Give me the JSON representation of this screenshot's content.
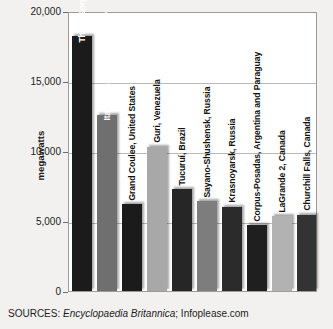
{
  "chart_data": {
    "type": "bar",
    "title": "",
    "xlabel": "",
    "ylabel": "megawatts",
    "ylim": [
      0,
      20000
    ],
    "grid": true,
    "legend": "none",
    "yticks": [
      "0",
      "5,000",
      "10,000",
      "15,000",
      "20,000"
    ],
    "ytick_values": [
      0,
      5000,
      10000,
      15000,
      20000
    ],
    "categories": [
      "Three Gorges, China",
      "Itaipu, Brazil and Paraguay",
      "Grand Coulee, United States",
      "Guri, Venezuela",
      "Tucuruí, Brazil",
      "Sayano-Shushensk, Russia",
      "Krasnoyarsk, Russia",
      "Corpus-Posadas, Argentina and Paraguay",
      "LaGrande 2, Canada",
      "Churchill Falls, Canada"
    ],
    "values": [
      18200,
      12600,
      6180,
      10300,
      7260,
      6400,
      6000,
      4700,
      5328,
      5428
    ],
    "bar_colors": [
      "#1b1b1b",
      "#6f6f6f",
      "#1b1b1b",
      "#a8a8a8",
      "#262626",
      "#7d7d7d",
      "#2b2b2b",
      "#1f1f1f",
      "#b2b2b2",
      "#333333"
    ],
    "label_placement": [
      "inside",
      "inside",
      "outside",
      "outside",
      "outside",
      "outside",
      "outside",
      "outside",
      "outside",
      "outside"
    ]
  },
  "footer": {
    "sources_prefix": "SOURCES:",
    "source_italic": "Encyclopaedia Britannica",
    "source_rest": "; Infoplease.com"
  },
  "colors": {
    "plot_background": "#ffffff",
    "page_background": "#f2f1ef",
    "gridline": "#b9b9b7",
    "axis": "#9a9a98",
    "text": "#1d1d1d"
  }
}
